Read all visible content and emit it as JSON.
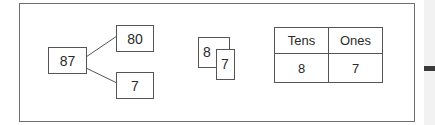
{
  "diagram": {
    "number_bond": {
      "whole": "87",
      "parts": [
        "80",
        "7"
      ]
    },
    "digit_cards": {
      "back": "8",
      "front": "7"
    },
    "place_value_chart": {
      "headers": [
        "Tens",
        "Ones"
      ],
      "values": [
        "8",
        "7"
      ]
    }
  },
  "colors": {
    "border": "#555555",
    "frame": "#6f6f6f",
    "text": "#2a2a2a",
    "side_bar": "#3a3a3a"
  }
}
